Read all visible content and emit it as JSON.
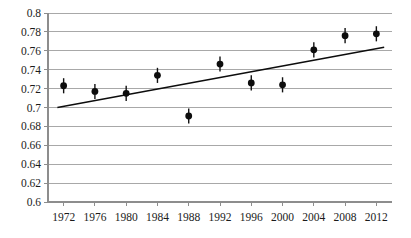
{
  "chart_data": {
    "type": "scatter",
    "title": "",
    "subtitle": "",
    "xlabel": "",
    "ylabel": "",
    "xlim": [
      1970,
      2014
    ],
    "ylim": [
      0.6,
      0.8
    ],
    "grid": true,
    "legend": null,
    "y_ticks": [
      "0.8",
      "0.78",
      "0.76",
      "0.74",
      "0.72",
      "0.7",
      "0.68",
      "0.66",
      "0.64",
      "0.62",
      "0.6"
    ],
    "y_tick_values": [
      0.8,
      0.78,
      0.76,
      0.74,
      0.72,
      0.7,
      0.68,
      0.66,
      0.64,
      0.62,
      0.6
    ],
    "x_ticks": [
      "1972",
      "1976",
      "1980",
      "1984",
      "1988",
      "1992",
      "1996",
      "2000",
      "2004",
      "2008",
      "2012"
    ],
    "x_tick_values": [
      1972,
      1976,
      1980,
      1984,
      1988,
      1992,
      1996,
      2000,
      2004,
      2008,
      2012
    ],
    "categories": [
      1972,
      1976,
      1980,
      1984,
      1988,
      1992,
      1996,
      2000,
      2004,
      2008,
      2012
    ],
    "values": [
      0.723,
      0.717,
      0.715,
      0.734,
      0.691,
      0.746,
      0.726,
      0.724,
      0.761,
      0.776,
      0.778
    ],
    "errors": [
      0.008,
      0.008,
      0.008,
      0.008,
      0.008,
      0.008,
      0.008,
      0.008,
      0.008,
      0.008,
      0.008
    ],
    "series": [
      {
        "name": "observations",
        "marker": "filled-circle-with-error-bars",
        "color": "#0d0d0d",
        "x": [
          1972,
          1976,
          1980,
          1984,
          1988,
          1992,
          1996,
          2000,
          2004,
          2008,
          2012
        ],
        "values": [
          0.723,
          0.717,
          0.715,
          0.734,
          0.691,
          0.746,
          0.726,
          0.724,
          0.761,
          0.776,
          0.778
        ],
        "errors": [
          0.008,
          0.008,
          0.008,
          0.008,
          0.008,
          0.008,
          0.008,
          0.008,
          0.008,
          0.008,
          0.008
        ]
      },
      {
        "name": "trend-line",
        "marker": "line",
        "color": "#0d0d0d",
        "x": [
          1971.2,
          2013.0
        ],
        "values": [
          0.7,
          0.7638
        ]
      }
    ],
    "colors": {
      "marker": "#0d0d0d",
      "trendline": "#0d0d0d",
      "gridline": "#a8a8a8",
      "axis": "#8d8d8d",
      "background": "#ffffff",
      "text": "#1b1b1b"
    }
  },
  "plot_geometry": {
    "left": 48,
    "right": 392,
    "top": 13,
    "bottom": 202
  }
}
